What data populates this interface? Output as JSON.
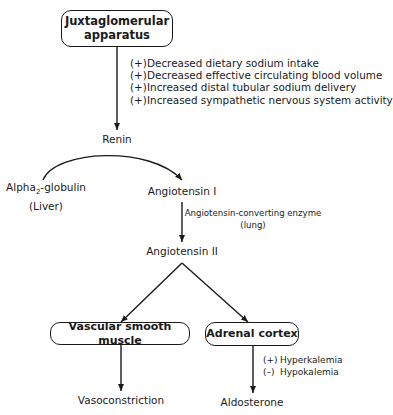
{
  "nodes": {
    "jga": {
      "line1": "Juxtaglomerular",
      "line2": "apparatus"
    },
    "renin": "Renin",
    "alpha": {
      "main": "Alpha",
      "sub": "2",
      "rest": "-globulin",
      "note": "(Liver)"
    },
    "ang1": "Angiotensin I",
    "ace": {
      "line1": "Angiotensin-converting enzyme",
      "line2": "(lung)"
    },
    "ang2": "Angiotensin II",
    "vsm": "Vascular smooth muscle",
    "adrenal": "Adrenal cortex",
    "vasoconstriction": "Vasoconstriction",
    "aldosterone": "Aldosterone"
  },
  "renin_stimuli": [
    {
      "sign": "(+)",
      "text": "Decreased dietary sodium intake"
    },
    {
      "sign": "(+)",
      "text": "Decreased effective circulating blood volume"
    },
    {
      "sign": "(+)",
      "text": "Increased distal tubular sodium delivery"
    },
    {
      "sign": "(+)",
      "text": "Increased sympathetic nervous system activity"
    }
  ],
  "aldosterone_modulators": [
    {
      "sign": "(+)",
      "text": "Hyperkalemia"
    },
    {
      "sign": "(–)",
      "text": "Hypokalemia"
    }
  ]
}
